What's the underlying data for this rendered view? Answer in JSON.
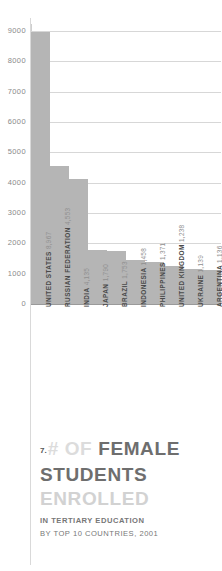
{
  "chart_data": {
    "type": "bar",
    "title": "# OF FEMALE STUDENTS ENROLLED",
    "subtitle_line1": "IN TERTIARY EDUCATION",
    "subtitle_line2": "BY TOP 10 COUNTRIES, 2001",
    "figure_number": "7.",
    "xlabel": "",
    "ylabel": "",
    "ylim": [
      0,
      9000
    ],
    "grid": true,
    "legend": "none",
    "ytick_labels": [
      "9000",
      "8000",
      "7000",
      "6000",
      "5000",
      "4000",
      "3000",
      "2000",
      "1000",
      "0"
    ],
    "yticks": [
      9000,
      8000,
      7000,
      6000,
      5000,
      4000,
      3000,
      2000,
      1000,
      0
    ],
    "categories": [
      "UNITED STATES",
      "RUSSIAN FEDERATION",
      "INDIA",
      "JAPAN",
      "BRAZIL",
      "INDONESIA",
      "PHILIPPINES",
      "UNITED KINGDOM",
      "UKRAINE",
      "ARGENTINA"
    ],
    "value_labels": [
      "8,967",
      "4,553",
      "4,135",
      "1,790",
      "1,753",
      "1,458",
      "1,371",
      "1,238",
      "1,139",
      "1,136"
    ],
    "values": [
      8967,
      4553,
      4135,
      1790,
      1753,
      1458,
      1371,
      1238,
      1139,
      1136
    ],
    "bar_color": "#b5b5b5",
    "grid_color": "#d7d7d7",
    "axis_color": "#9a9a9a"
  },
  "title_parts": {
    "p1": "# OF",
    "p2": "FEMALE",
    "p3": "STUDENTS",
    "p4": "ENROLLED"
  }
}
